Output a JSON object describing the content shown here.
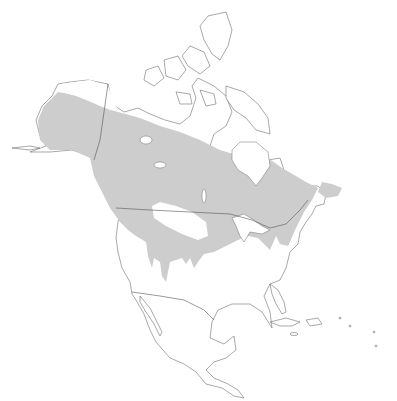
{
  "map": {
    "title": "",
    "region": "North America",
    "legend": [],
    "colors": {
      "background": "#ffffff",
      "land": "#ffffff",
      "outline": "#6e6e6e",
      "range_fill": "#cdcdcd"
    }
  }
}
